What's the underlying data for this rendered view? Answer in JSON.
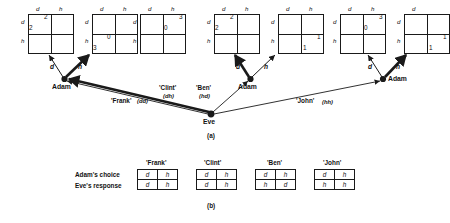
{
  "figure": {
    "caption_a": "(a)",
    "caption_b": "(b)"
  },
  "matrix_axis": {
    "col_d": "d",
    "col_h": "h",
    "row_d": "d",
    "row_h": "h"
  },
  "matrices": [
    {
      "id": "m1",
      "payoff_left": "2",
      "payoff_right": "2",
      "cell": "top-left"
    },
    {
      "id": "m2",
      "payoff_left": "3",
      "payoff_right": "0",
      "cell": "bottom-left"
    },
    {
      "id": "m3",
      "payoff_left": "2",
      "payoff_right": "2",
      "cell": "top-left"
    },
    {
      "id": "m4",
      "payoff_left": "1",
      "payoff_right": "1",
      "cell": "bottom-right"
    },
    {
      "id": "m5",
      "payoff_left": "0",
      "payoff_right": "3",
      "cell": "top-right"
    },
    {
      "id": "m6",
      "payoff_left": "3",
      "payoff_right": "0",
      "cell": "bottom-left"
    },
    {
      "id": "m7",
      "payoff_left": "0",
      "payoff_right": "3",
      "cell": "top-right"
    },
    {
      "id": "m8",
      "payoff_left": "1",
      "payoff_right": "1",
      "cell": "bottom-right"
    }
  ],
  "nodes": {
    "adam_left": "Adam",
    "adam_right": "Adam",
    "adam_far_right": "Adam",
    "eve": "Eve"
  },
  "branches": {
    "adam_left_d": "d",
    "adam_left_h": "h",
    "adam_right_d": "d",
    "adam_right_h": "h"
  },
  "strategies": [
    {
      "name": "'Frank'",
      "code": "(dd)"
    },
    {
      "name": "'Clint'",
      "code": "(dh)"
    },
    {
      "name": "'Ben'",
      "code": "(hd)"
    },
    {
      "name": "'John'",
      "code": "(hh)"
    }
  ],
  "table": {
    "row_labels": {
      "adam": "Adam's choice",
      "eve": "Eve's response"
    },
    "columns": [
      {
        "header": "'Frank'",
        "adam_choice": [
          "d",
          "h"
        ],
        "eve_response": [
          "d",
          "h"
        ]
      },
      {
        "header": "'Clint'",
        "adam_choice": [
          "d",
          "h"
        ],
        "eve_response": [
          "d",
          "h"
        ]
      },
      {
        "header": "'Ben'",
        "adam_choice": [
          "d",
          "h"
        ],
        "eve_response": [
          "h",
          "d"
        ]
      },
      {
        "header": "'John'",
        "adam_choice": [
          "d",
          "h"
        ],
        "eve_response": [
          "h",
          "h"
        ]
      }
    ]
  },
  "colors": {
    "ink": "#1a1a1a",
    "paper": "#ffffff"
  }
}
